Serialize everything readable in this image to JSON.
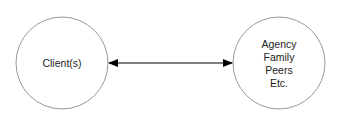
{
  "diagram": {
    "left_node": {
      "lines": [
        "Client(s)"
      ]
    },
    "right_node": {
      "lines": [
        "Agency",
        "Family",
        "Peers",
        "Etc."
      ]
    },
    "connector": {
      "type": "bidirectional-arrow"
    },
    "colors": {
      "stroke": "#999999",
      "arrow": "#000000",
      "text": "#222222"
    }
  }
}
